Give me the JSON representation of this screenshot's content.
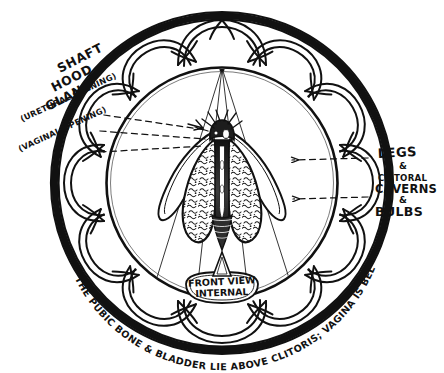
{
  "canvas": {
    "width": 444,
    "height": 373,
    "background": "#ffffff"
  },
  "title_banner": {
    "line1": "FRONT VIEW",
    "line2": "INTERNAL"
  },
  "labels_left": {
    "stack": [
      "SHAFT",
      "HOOD",
      "GLANS"
    ],
    "urethral": "(URETHRAL OPENING)",
    "vaginal": "(VAGINAL OPENING)"
  },
  "labels_right": {
    "legs": "LEGS",
    "amp1": "&",
    "clitoral": "CLITORAL",
    "caverns": "CAVERNS",
    "amp2": "&",
    "bulbs": "BULBS"
  },
  "caption_arc": "THE PUBIC BONE & BLADDER LIE ABOVE CLITORIS; VAGINA IS BELOW.",
  "caption_arc_parts": [
    "THE PUBIC BONE",
    "& BLADDER",
    "LIE ABOVE",
    "CLITORIS;",
    "VAGINA IS BELOW."
  ],
  "colors": {
    "ink": "#111111",
    "paper": "#ffffff",
    "stipple": "#2a2a2a",
    "shade": "#3a3a3a"
  },
  "figure": {
    "glans_label": "glans",
    "legs_label": "crura-legs",
    "bulbs_label": "vestibular-bulbs",
    "urethra_label": "urethral-opening",
    "vagina_label": "vaginal-opening"
  },
  "geometry": {
    "outer_ring_radius": 172,
    "inner_circle_radius": 116,
    "petal_count": 12,
    "center_x": 222,
    "center_y": 183
  }
}
